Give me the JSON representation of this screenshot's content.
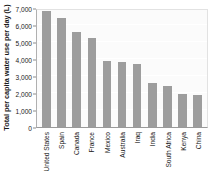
{
  "chart_data": {
    "type": "bar",
    "title": "",
    "xlabel": "",
    "ylabel": "Total per capita water use per day (L)",
    "ylim": [
      0,
      7000
    ],
    "ytick_step": 1000,
    "grid": true,
    "legend": false,
    "bar_color": "#9d9d9d",
    "plot_background": "#fbfbfb",
    "ytick_labels": [
      "7,000",
      "6,000",
      "5,000",
      "4,000",
      "3,000",
      "2,000",
      "1,000",
      "0"
    ],
    "ytick_values": [
      7000,
      6000,
      5000,
      4000,
      3000,
      2000,
      1000,
      0
    ],
    "categories": [
      "United States",
      "Spain",
      "Canada",
      "France",
      "Mexico",
      "Australia",
      "Iraq",
      "India",
      "South Africa",
      "Kenya",
      "China"
    ],
    "values": [
      6800,
      6400,
      5600,
      5250,
      3900,
      3800,
      3700,
      2600,
      2400,
      1950,
      1900
    ]
  }
}
